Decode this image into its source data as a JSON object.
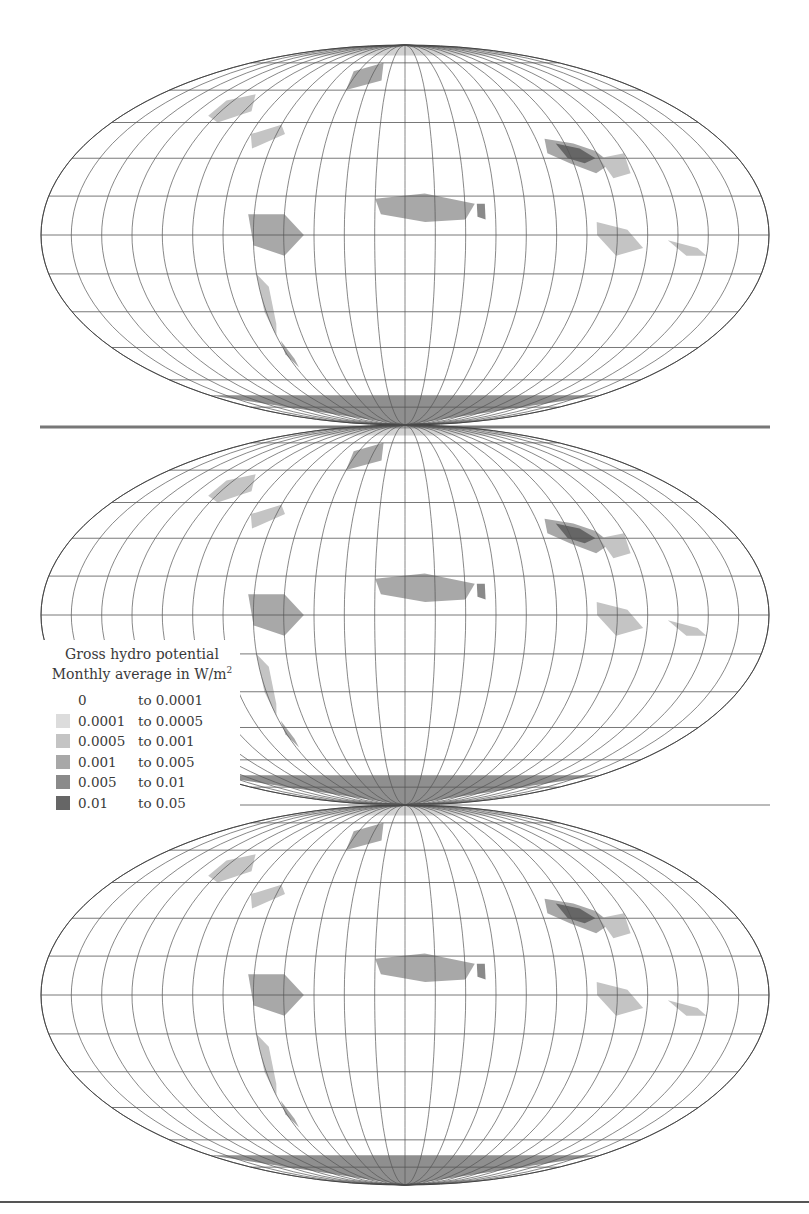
{
  "figure": {
    "panels": [
      {
        "id": "panel-1",
        "label": "Map panel 1"
      },
      {
        "id": "panel-2",
        "label": "Map panel 2"
      },
      {
        "id": "panel-3",
        "label": "Map panel 3"
      }
    ],
    "projection": "Mollweide",
    "colors": {
      "graticule": "#555555",
      "coast": "#333333",
      "class_colors": [
        "#ffffff",
        "#dcdcdc",
        "#c4c4c4",
        "#a8a8a8",
        "#8a8a8a",
        "#666666"
      ]
    }
  },
  "legend": {
    "title_line1": "Gross hydro potential",
    "title_line2_prefix": "Monthly average in W/m",
    "title_line2_sup": "2",
    "classes": [
      {
        "from": "0",
        "to": "to 0.0001",
        "color": "#ffffff"
      },
      {
        "from": "0.0001",
        "to": "to 0.0005",
        "color": "#dcdcdc"
      },
      {
        "from": "0.0005",
        "to": "to 0.001",
        "color": "#c4c4c4"
      },
      {
        "from": "0.001",
        "to": "to 0.005",
        "color": "#a8a8a8"
      },
      {
        "from": "0.005",
        "to": "to 0.01",
        "color": "#8a8a8a"
      },
      {
        "from": "0.01",
        "to": "to 0.05",
        "color": "#666666"
      }
    ]
  }
}
